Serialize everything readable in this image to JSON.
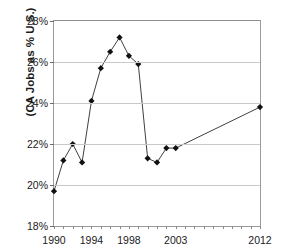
{
  "chart_data": {
    "type": "line",
    "title": "California Share of U.S. Jobs",
    "title_clipped": true,
    "xlabel": "",
    "ylabel": "(CA Jobs as % U.S.)",
    "ylim": [
      18,
      28
    ],
    "ytick_labels": [
      "18%",
      "20%",
      "22%",
      "24%",
      "26%",
      "28%"
    ],
    "ytick_values": [
      18,
      20,
      22,
      24,
      26,
      28
    ],
    "xlim": [
      1990,
      2012
    ],
    "xtick_labels": [
      "1990",
      "1994",
      "1998",
      "2003",
      "2012"
    ],
    "xtick_values": [
      1990,
      1994,
      1998,
      2003,
      2012
    ],
    "grid": "horizontal",
    "legend": "none",
    "marker": "diamond",
    "line_color": "#404040",
    "marker_color": "#111111",
    "x": [
      1990,
      1991,
      1992,
      1993,
      1994,
      1995,
      1996,
      1997,
      1998,
      1999,
      2000,
      2001,
      2002,
      2003,
      2012
    ],
    "values": [
      19.7,
      21.2,
      22.0,
      21.1,
      24.1,
      25.7,
      26.5,
      27.2,
      26.3,
      25.9,
      21.3,
      21.1,
      21.8,
      21.8,
      23.8
    ],
    "series": [
      {
        "name": "CA Jobs as % U.S.",
        "values": [
          19.7,
          21.2,
          22.0,
          21.1,
          24.1,
          25.7,
          26.5,
          27.2,
          26.3,
          25.9,
          21.3,
          21.1,
          21.8,
          21.8,
          23.8
        ]
      }
    ]
  }
}
